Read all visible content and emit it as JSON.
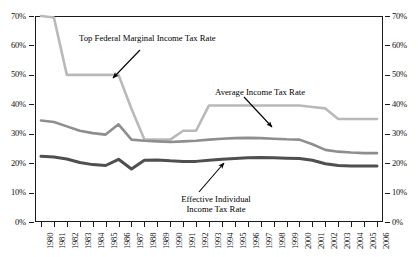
{
  "chart_data": {
    "type": "line",
    "title": "",
    "subtitle": "",
    "xlabel": "",
    "ylabel": "",
    "ylim": [
      0,
      70
    ],
    "ytick_labels": [
      "0%",
      "10%",
      "20%",
      "30%",
      "40%",
      "50%",
      "60%",
      "70%"
    ],
    "ytick_values": [
      0,
      10,
      20,
      30,
      40,
      50,
      60,
      70
    ],
    "dual_y_axis": true,
    "grid": false,
    "legend": "annotations",
    "x": [
      1980,
      1981,
      1982,
      1983,
      1984,
      1985,
      1986,
      1987,
      1988,
      1989,
      1990,
      1991,
      1992,
      1993,
      1994,
      1995,
      1996,
      1997,
      1998,
      1999,
      2000,
      2001,
      2002,
      2003,
      2004,
      2005,
      2006
    ],
    "categories": [
      "1980",
      "1981",
      "1982",
      "1983",
      "1984",
      "1985",
      "1986",
      "1987",
      "1988",
      "1989",
      "1990",
      "1991",
      "1992",
      "1993",
      "1994",
      "1995",
      "1996",
      "1997",
      "1998",
      "1999",
      "2000",
      "2001",
      "2002",
      "2003",
      "2004",
      "2005",
      "2006"
    ],
    "series": [
      {
        "name": "Top Federal Marginal Income Tax Rate",
        "color": "#b9b9b9",
        "width": 2.6,
        "values": [
          70,
          69.5,
          50,
          50,
          50,
          50,
          50,
          38.5,
          28,
          28,
          28,
          31,
          31,
          39.6,
          39.6,
          39.6,
          39.6,
          39.6,
          39.6,
          39.6,
          39.6,
          39.1,
          38.6,
          35,
          35,
          35,
          35
        ]
      },
      {
        "name": "Average Income Tax Rate",
        "color": "#8e8e8e",
        "width": 2.6,
        "values": [
          34.5,
          34.0,
          32.5,
          31.0,
          30.2,
          29.7,
          33.2,
          28.0,
          27.6,
          27.4,
          27.2,
          27.4,
          27.6,
          28.0,
          28.3,
          28.5,
          28.6,
          28.5,
          28.3,
          28.1,
          28.0,
          26.4,
          24.5,
          23.9,
          23.6,
          23.4,
          23.4
        ]
      },
      {
        "name": "Effective Individual Income Tax Rate",
        "color": "#4f4f4f",
        "width": 3.0,
        "values": [
          22.3,
          22.1,
          21.4,
          20.2,
          19.5,
          19.2,
          21.3,
          18.0,
          21.0,
          21.1,
          20.8,
          20.6,
          20.6,
          21.0,
          21.3,
          21.6,
          21.8,
          21.9,
          21.8,
          21.7,
          21.6,
          21.0,
          19.8,
          19.2,
          19.0,
          19.0,
          19.0
        ]
      }
    ],
    "annotations": [
      {
        "id": "annotation-top-marginal",
        "text": "Top Federal Marginal Income Tax Rate",
        "lines": [
          "Top Federal Marginal Income Tax Rate"
        ]
      },
      {
        "id": "annotation-average",
        "text": "Average Income Tax Rate",
        "lines": [
          "Average Income Tax Rate"
        ]
      },
      {
        "id": "annotation-effective",
        "text": "Effective Individual Income Tax Rate",
        "lines": [
          "Effective Individual",
          "Income Tax Rate"
        ]
      }
    ]
  },
  "axes": {
    "left": {
      "labels": [
        "70%",
        "60%",
        "50%",
        "40%",
        "30%",
        "20%",
        "10%",
        "0%"
      ]
    },
    "right": {
      "labels": [
        "70%",
        "60%",
        "50%",
        "40%",
        "30%",
        "20%",
        "10%",
        "0%"
      ]
    },
    "bottom": {
      "labels": [
        "1980",
        "1981",
        "1982",
        "1983",
        "1984",
        "1985",
        "1986",
        "1987",
        "1988",
        "1989",
        "1990",
        "1991",
        "1992",
        "1993",
        "1994",
        "1995",
        "1996",
        "1997",
        "1998",
        "1999",
        "2000",
        "2001",
        "2002",
        "2003",
        "2004",
        "2005",
        "2006"
      ]
    }
  },
  "colors": {
    "series_top": "#b9b9b9",
    "series_average": "#8e8e8e",
    "series_effective": "#4f4f4f",
    "frame": "#1a1a1a",
    "text": "#111111",
    "background": "#ffffff"
  }
}
